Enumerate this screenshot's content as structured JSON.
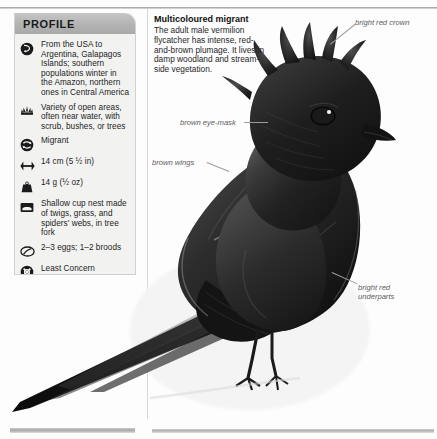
{
  "page": {
    "background_color": "#fdfdfd",
    "divider_color": "#d7d7d7"
  },
  "profile": {
    "header_label": "PROFILE",
    "header_color": "#b4b4b4",
    "panel_color": "#f2f2f0",
    "rows": [
      {
        "icon": "globe-distribution-icon",
        "text": "From the USA to Argentina, Galapagos Islands; southern populations winter in the Amazon, northern ones in Central America"
      },
      {
        "icon": "habitat-scrub-icon",
        "text": "Variety of open areas, often near water, with scrub, bushes, or trees"
      },
      {
        "icon": "migration-arrows-icon",
        "text": "Migrant"
      },
      {
        "icon": "length-arrows-icon",
        "text": "14 cm (5 ½ in)"
      },
      {
        "icon": "weight-icon",
        "text": "14 g (½ oz)"
      },
      {
        "icon": "nest-icon",
        "text": "Shallow cup nest made of twigs, grass, and spiders' webs, in tree fork"
      },
      {
        "icon": "egg-icon",
        "text": "2–3 eggs; 1–2 broods"
      },
      {
        "icon": "conservation-status-icon",
        "text": "Least Concern"
      },
      {
        "icon": "flock-icon",
        "text": "Small flocks"
      }
    ]
  },
  "caption": {
    "title": "Multicoloured migrant",
    "body": "The adult male vermilion flycatcher has intense, red-and-brown plumage. It lives in damp woodland and stream-side vegetation."
  },
  "annotations": [
    {
      "id": "bright-red-crown",
      "text": "bright red crown"
    },
    {
      "id": "brown-eye-mask",
      "text": "brown eye-mask"
    },
    {
      "id": "brown-wings",
      "text": "brown wings"
    },
    {
      "id": "bright-red-underparts-line1",
      "text": "bright red"
    },
    {
      "id": "bright-red-underparts-line2",
      "text": "underparts"
    }
  ],
  "illustration": {
    "subject": "vermilion-flycatcher-photograph",
    "rendering": "grayscale"
  }
}
